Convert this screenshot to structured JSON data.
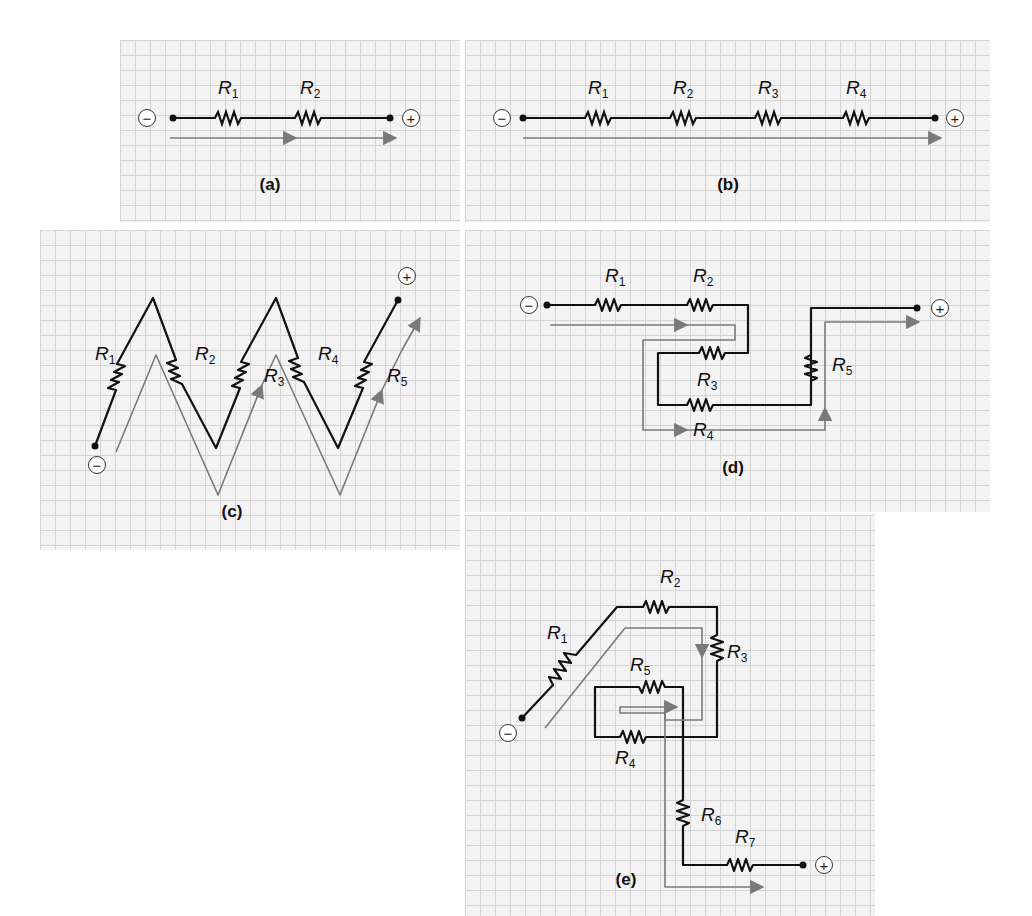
{
  "figure": {
    "colors": {
      "background": "#ffffff",
      "grid_fill": "#f3f3f3",
      "grid_line": "#d4d4d4",
      "wire": "#111111",
      "current_arrow": "#7a7a7a"
    },
    "terminal_symbols": {
      "negative": "−",
      "positive": "+"
    },
    "panels": [
      {
        "id": "a",
        "caption": "(a)",
        "resistors": [
          "R1",
          "R2"
        ],
        "resistor_labels": [
          {
            "base": "R",
            "sub": "1"
          },
          {
            "base": "R",
            "sub": "2"
          }
        ]
      },
      {
        "id": "b",
        "caption": "(b)",
        "resistors": [
          "R1",
          "R2",
          "R3",
          "R4"
        ],
        "resistor_labels": [
          {
            "base": "R",
            "sub": "1"
          },
          {
            "base": "R",
            "sub": "2"
          },
          {
            "base": "R",
            "sub": "3"
          },
          {
            "base": "R",
            "sub": "4"
          }
        ]
      },
      {
        "id": "c",
        "caption": "(c)",
        "resistors": [
          "R1",
          "R2",
          "R3",
          "R4",
          "R5"
        ],
        "resistor_labels": [
          {
            "base": "R",
            "sub": "1"
          },
          {
            "base": "R",
            "sub": "2"
          },
          {
            "base": "R",
            "sub": "3"
          },
          {
            "base": "R",
            "sub": "4"
          },
          {
            "base": "R",
            "sub": "5"
          }
        ]
      },
      {
        "id": "d",
        "caption": "(d)",
        "resistors": [
          "R1",
          "R2",
          "R3",
          "R4",
          "R5"
        ],
        "resistor_labels": [
          {
            "base": "R",
            "sub": "1"
          },
          {
            "base": "R",
            "sub": "2"
          },
          {
            "base": "R",
            "sub": "3"
          },
          {
            "base": "R",
            "sub": "4"
          },
          {
            "base": "R",
            "sub": "5"
          }
        ]
      },
      {
        "id": "e",
        "caption": "(e)",
        "resistors": [
          "R1",
          "R2",
          "R3",
          "R4",
          "R5",
          "R6",
          "R7"
        ],
        "resistor_labels": [
          {
            "base": "R",
            "sub": "1"
          },
          {
            "base": "R",
            "sub": "2"
          },
          {
            "base": "R",
            "sub": "3"
          },
          {
            "base": "R",
            "sub": "4"
          },
          {
            "base": "R",
            "sub": "5"
          },
          {
            "base": "R",
            "sub": "6"
          },
          {
            "base": "R",
            "sub": "7"
          }
        ]
      }
    ]
  }
}
